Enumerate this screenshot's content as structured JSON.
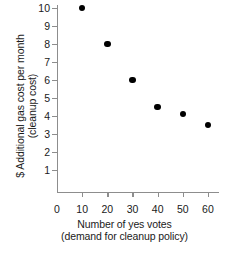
{
  "chart_data": {
    "type": "scatter",
    "title": "",
    "xlabel": "Number of yes votes",
    "xlabel_sub": "(demand for cleanup policy)",
    "ylabel": "$ Additional gas cost per month",
    "ylabel_sub": "(cleanup cost)",
    "x": [
      10,
      20,
      30,
      40,
      50,
      60
    ],
    "values": [
      10,
      8,
      6,
      4.5,
      4.1,
      3.5
    ],
    "series": [
      {
        "name": "cleanup cost vs yes votes",
        "points": [
          {
            "x": 10,
            "y": 10
          },
          {
            "x": 20,
            "y": 8
          },
          {
            "x": 30,
            "y": 6
          },
          {
            "x": 40,
            "y": 4.5
          },
          {
            "x": 50,
            "y": 4.1
          },
          {
            "x": 60,
            "y": 3.5
          }
        ]
      }
    ],
    "xlim": [
      0,
      62
    ],
    "ylim": [
      0,
      10.4
    ],
    "xticks": [
      0,
      10,
      20,
      30,
      40,
      50,
      60
    ],
    "yticks": [
      1,
      2,
      3,
      4,
      5,
      6,
      7,
      8,
      9,
      10
    ],
    "xticklabels": [
      "0",
      "10",
      "20",
      "30",
      "40",
      "50",
      "60"
    ],
    "yticklabels": [
      "1",
      "2",
      "3",
      "4",
      "5",
      "6",
      "7",
      "8",
      "9",
      "10"
    ],
    "grid": false,
    "legend": false,
    "legend_position": "none",
    "marker_color": "#000000",
    "axis_color": "#8d8d8d",
    "background_color": "#ffffff"
  }
}
